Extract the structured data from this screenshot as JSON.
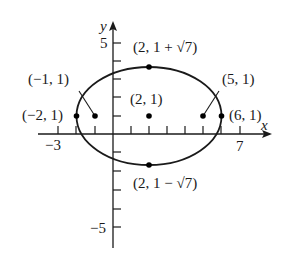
{
  "diagram": {
    "type": "ellipse-graph",
    "axes": {
      "x_label": "x",
      "y_label": "y",
      "x_tick_labels": [
        {
          "value": -3,
          "text": "−3"
        },
        {
          "value": 7,
          "text": "7"
        }
      ],
      "y_tick_labels": [
        {
          "value": 5,
          "text": "5"
        },
        {
          "value": -5,
          "text": "−5"
        }
      ]
    },
    "ellipse": {
      "center": [
        2,
        1
      ],
      "semi_major": 4,
      "semi_minor": 2.6458
    },
    "points": [
      {
        "id": "center",
        "label": "(2, 1)",
        "x": 2,
        "y": 1
      },
      {
        "id": "vertex-left",
        "label": "(−2, 1)",
        "x": -2,
        "y": 1
      },
      {
        "id": "vertex-right",
        "label": "(6, 1)",
        "x": 6,
        "y": 1
      },
      {
        "id": "focus-left",
        "label": "(−1, 1)",
        "x": -1,
        "y": 1
      },
      {
        "id": "focus-right",
        "label": "(5, 1)",
        "x": 5,
        "y": 1
      },
      {
        "id": "co-vertex-top",
        "label": "(2, 1 + √7)",
        "x": 2,
        "y": 3.6458
      },
      {
        "id": "co-vertex-bottom",
        "label": "(2, 1 − √7)",
        "x": 2,
        "y": -1.6458
      }
    ]
  }
}
